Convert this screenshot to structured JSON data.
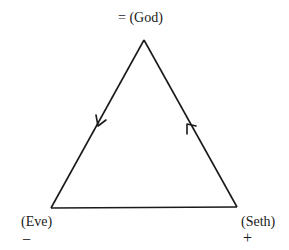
{
  "diagram": {
    "title": "",
    "vertices": {
      "top": {
        "label": "= (God)",
        "name": "God",
        "sign": "="
      },
      "left": {
        "label": "(Eve)",
        "name": "Eve",
        "sign": "−"
      },
      "right": {
        "label": "(Seth)",
        "name": "Seth",
        "sign": "+"
      }
    },
    "edges": [
      {
        "from": "God",
        "to": "Eve",
        "arrow_direction": "down-left",
        "description": "arrow pointing from God toward Eve"
      },
      {
        "from": "Seth",
        "to": "God",
        "arrow_direction": "up-left",
        "description": "arrow pointing from Seth toward God"
      },
      {
        "from": "Eve",
        "to": "Seth",
        "arrow_direction": "none",
        "description": "base line, no arrow"
      }
    ],
    "colors": {
      "line": "#1a1a1a",
      "background": "#ffffff"
    }
  }
}
